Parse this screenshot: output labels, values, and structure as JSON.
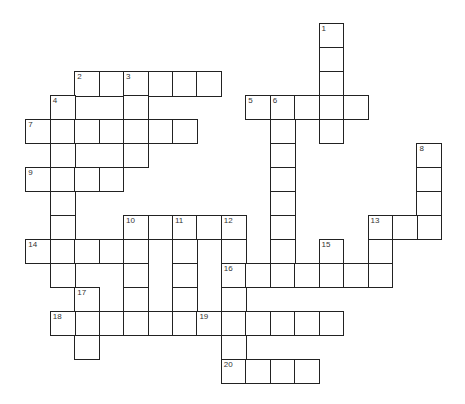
{
  "puzzle": {
    "type": "crossword",
    "grid": {
      "origin_x": 26,
      "origin_y": 24,
      "cell_w": 24.45,
      "cell_h": 23.95
    },
    "cells": [
      [
        0,
        12,
        "1"
      ],
      [
        1,
        12,
        ""
      ],
      [
        2,
        12,
        ""
      ],
      [
        3,
        12,
        ""
      ],
      [
        4,
        12,
        ""
      ],
      [
        2,
        2,
        "2"
      ],
      [
        2,
        3,
        ""
      ],
      [
        2,
        4,
        "3"
      ],
      [
        2,
        5,
        ""
      ],
      [
        2,
        6,
        ""
      ],
      [
        2,
        7,
        ""
      ],
      [
        3,
        4,
        ""
      ],
      [
        4,
        4,
        ""
      ],
      [
        5,
        4,
        ""
      ],
      [
        3,
        1,
        "4"
      ],
      [
        4,
        1,
        ""
      ],
      [
        5,
        1,
        ""
      ],
      [
        6,
        1,
        ""
      ],
      [
        7,
        1,
        ""
      ],
      [
        8,
        1,
        ""
      ],
      [
        9,
        1,
        ""
      ],
      [
        10,
        1,
        ""
      ],
      [
        3,
        9,
        "5"
      ],
      [
        3,
        10,
        "6"
      ],
      [
        3,
        11,
        ""
      ],
      [
        3,
        13,
        ""
      ],
      [
        4,
        10,
        ""
      ],
      [
        5,
        10,
        ""
      ],
      [
        6,
        10,
        ""
      ],
      [
        7,
        10,
        ""
      ],
      [
        8,
        10,
        ""
      ],
      [
        9,
        10,
        ""
      ],
      [
        10,
        10,
        ""
      ],
      [
        4,
        0,
        "7"
      ],
      [
        4,
        2,
        ""
      ],
      [
        4,
        3,
        ""
      ],
      [
        4,
        5,
        ""
      ],
      [
        4,
        6,
        ""
      ],
      [
        5,
        16,
        "8"
      ],
      [
        6,
        16,
        ""
      ],
      [
        7,
        16,
        ""
      ],
      [
        8,
        16,
        ""
      ],
      [
        6,
        0,
        "9"
      ],
      [
        6,
        2,
        ""
      ],
      [
        6,
        3,
        ""
      ],
      [
        8,
        4,
        "10"
      ],
      [
        8,
        5,
        ""
      ],
      [
        8,
        6,
        "11"
      ],
      [
        8,
        7,
        ""
      ],
      [
        8,
        8,
        "12"
      ],
      [
        9,
        4,
        ""
      ],
      [
        10,
        4,
        ""
      ],
      [
        11,
        4,
        ""
      ],
      [
        12,
        4,
        ""
      ],
      [
        9,
        6,
        ""
      ],
      [
        10,
        6,
        ""
      ],
      [
        11,
        6,
        ""
      ],
      [
        12,
        6,
        ""
      ],
      [
        9,
        8,
        ""
      ],
      [
        10,
        8,
        "16"
      ],
      [
        11,
        8,
        ""
      ],
      [
        12,
        8,
        ""
      ],
      [
        13,
        8,
        ""
      ],
      [
        14,
        8,
        "20"
      ],
      [
        8,
        14,
        "13"
      ],
      [
        8,
        15,
        ""
      ],
      [
        9,
        14,
        ""
      ],
      [
        10,
        14,
        ""
      ],
      [
        9,
        0,
        "14"
      ],
      [
        9,
        2,
        ""
      ],
      [
        9,
        3,
        ""
      ],
      [
        9,
        12,
        "15"
      ],
      [
        10,
        12,
        ""
      ],
      [
        10,
        9,
        ""
      ],
      [
        10,
        11,
        ""
      ],
      [
        10,
        13,
        ""
      ],
      [
        11,
        2,
        "17"
      ],
      [
        12,
        2,
        ""
      ],
      [
        13,
        2,
        ""
      ],
      [
        12,
        1,
        "18"
      ],
      [
        12,
        3,
        ""
      ],
      [
        12,
        5,
        ""
      ],
      [
        12,
        7,
        "19"
      ],
      [
        12,
        9,
        ""
      ],
      [
        12,
        10,
        ""
      ],
      [
        12,
        11,
        ""
      ],
      [
        12,
        12,
        ""
      ],
      [
        14,
        9,
        ""
      ],
      [
        14,
        10,
        ""
      ],
      [
        14,
        11,
        ""
      ]
    ],
    "across": [
      "2",
      "5",
      "7",
      "9",
      "10",
      "13",
      "14",
      "16",
      "18",
      "19",
      "20"
    ],
    "down": [
      "1",
      "3",
      "4",
      "6",
      "8",
      "10",
      "11",
      "12",
      "13",
      "15",
      "17"
    ]
  }
}
